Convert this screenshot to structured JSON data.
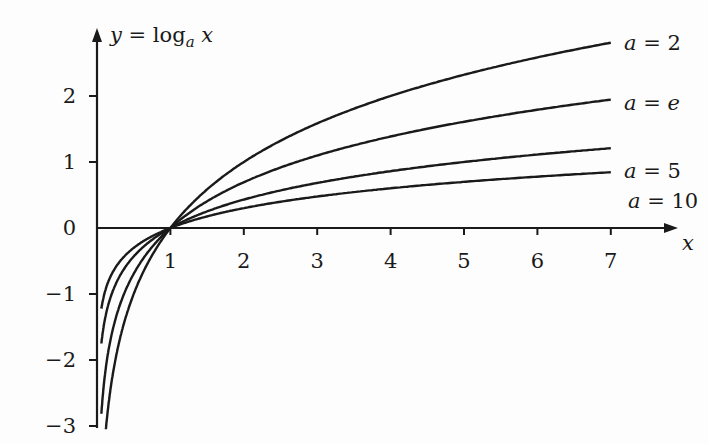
{
  "chart_data": {
    "type": "line",
    "ylabel": "y = log_a x",
    "xlabel": "x",
    "xlim": [
      0,
      7.8
    ],
    "ylim": [
      -3.2,
      3.0
    ],
    "x_ticks": [
      1,
      2,
      3,
      4,
      5,
      6,
      7
    ],
    "y_ticks": [
      -3,
      -2,
      -1,
      0,
      1,
      2
    ],
    "x_tick_labels": [
      "1",
      "2",
      "3",
      "4",
      "5",
      "6",
      "7"
    ],
    "y_tick_labels": [
      "−3",
      "−2",
      "−1",
      "0",
      "1",
      "2"
    ],
    "grid": false,
    "legend_position": "inline-right",
    "x_range": [
      0.1,
      7
    ],
    "series": [
      {
        "name": "a = 2",
        "base": 2,
        "values_at_x7": 2.81
      },
      {
        "name": "a = e",
        "base": 2.71828,
        "values_at_x7": 1.95
      },
      {
        "name": "a = 5",
        "base": 5,
        "values_at_x7": 1.21
      },
      {
        "name": "a = 10",
        "base": 10,
        "values_at_x7": 0.85
      }
    ]
  },
  "labels": {
    "y_axis_prefix": "y = log",
    "y_axis_sub": "a",
    "y_axis_suffix": " x",
    "x_axis": "x",
    "series": [
      "a = 2",
      "a = e",
      "a = 5",
      "a = 10"
    ]
  }
}
